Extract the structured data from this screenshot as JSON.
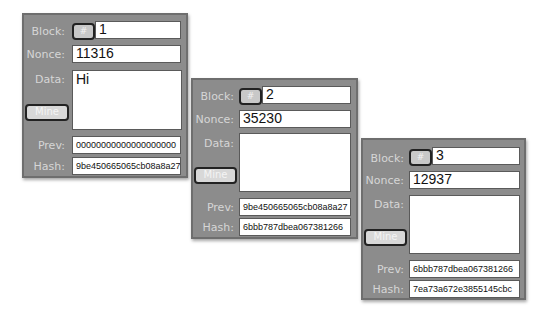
{
  "labels": {
    "block": "Block:",
    "nonce": "Nonce:",
    "data": "Data:",
    "prev": "Prev:",
    "hash": "Hash:",
    "mine": "Mine",
    "hash_button": "#"
  },
  "blocks": [
    {
      "block": "1",
      "nonce": "11316",
      "data": "Hi",
      "prev": "00000000000000000000",
      "hash": "9be450665065cb08a8a27"
    },
    {
      "block": "2",
      "nonce": "35230",
      "data": "",
      "prev": "9be450665065cb08a8a27",
      "hash": "6bbb787dbea067381266"
    },
    {
      "block": "3",
      "nonce": "12937",
      "data": "",
      "prev": "6bbb787dbea067381266",
      "hash": "7ea73a672e3855145cbc"
    }
  ],
  "colors": {
    "panel_bg": "#8c8c8c",
    "label_text": "#d6d6d6",
    "field_bg": "#ffffff"
  }
}
